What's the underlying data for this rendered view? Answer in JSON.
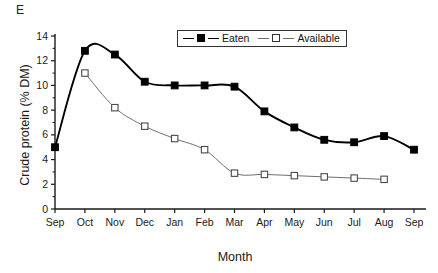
{
  "panel": {
    "label": "E"
  },
  "chart_data": {
    "type": "line",
    "title": "",
    "xlabel": "Month",
    "ylabel": "Crude protein (% DM)",
    "categories": [
      "Sep",
      "Oct",
      "Nov",
      "Dec",
      "Jan",
      "Feb",
      "Mar",
      "Apr",
      "May",
      "Jun",
      "Jul",
      "Aug",
      "Sep"
    ],
    "ylim": [
      0,
      14
    ],
    "yticks": [
      0,
      2,
      4,
      6,
      8,
      10,
      12,
      14
    ],
    "grid": false,
    "legend_position": "top-center",
    "series": [
      {
        "name": "Eaten",
        "marker": "filled-square",
        "color": "#000000",
        "values": [
          5.0,
          12.8,
          12.5,
          10.3,
          10.0,
          10.0,
          9.9,
          7.9,
          6.6,
          5.6,
          5.4,
          5.9,
          4.8
        ]
      },
      {
        "name": "Available",
        "marker": "open-square",
        "color": "#6f6f6f",
        "values": [
          null,
          11.0,
          8.2,
          6.7,
          5.7,
          4.8,
          2.9,
          2.8,
          2.7,
          2.6,
          2.5,
          2.4,
          null
        ]
      }
    ]
  },
  "legend": {
    "items": [
      {
        "label": "Eaten"
      },
      {
        "label": "Available"
      }
    ]
  }
}
